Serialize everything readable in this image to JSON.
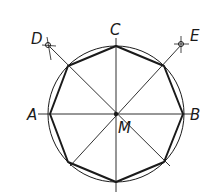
{
  "diagram": {
    "labels": {
      "A": "A",
      "B": "B",
      "C": "C",
      "D": "D",
      "E": "E",
      "M": "M"
    },
    "center": [
      116,
      114
    ],
    "radius": 68,
    "colors": {
      "stroke": "#1a1a1a",
      "background": "#ffffff"
    }
  }
}
